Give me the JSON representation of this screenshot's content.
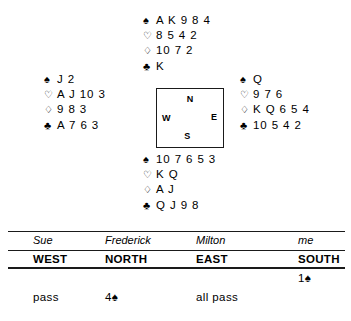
{
  "deal": {
    "suit_symbols": {
      "spade": "♠",
      "heart": "♡",
      "diamond": "♢",
      "club": "♣"
    },
    "hands": {
      "north": {
        "seat": "North",
        "spades": "A K 9 8 4",
        "hearts": "8 5 4 2",
        "diamonds": "10 7 2",
        "clubs": "K"
      },
      "west": {
        "seat": "West",
        "spades": "J 2",
        "hearts": "A J 10 3",
        "diamonds": "9 8 3",
        "clubs": "A 7 6 3"
      },
      "east": {
        "seat": "East",
        "spades": "Q",
        "hearts": "9 7 6",
        "diamonds": "K Q 6 5 4",
        "clubs": "10 5 4 2"
      },
      "south": {
        "seat": "South",
        "spades": "10 7 6 5 3",
        "hearts": "K Q",
        "diamonds": "A J",
        "clubs": "Q J 9 8"
      }
    },
    "compass": {
      "north": "N",
      "east": "E",
      "south": "S",
      "west": "W"
    }
  },
  "auction": {
    "players": {
      "west": "Sue",
      "north": "Frederick",
      "east": "Milton",
      "south": "me"
    },
    "seats": {
      "west": "WEST",
      "north": "NORTH",
      "east": "EAST",
      "south": "SOUTH"
    },
    "bids": {
      "row1": {
        "west": "",
        "north": "",
        "east": "",
        "south": "1♠"
      },
      "row2": {
        "west": "pass",
        "north": "4♠",
        "east": "all pass",
        "south": ""
      }
    }
  }
}
